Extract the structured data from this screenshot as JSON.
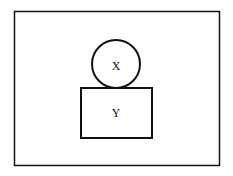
{
  "diagram": {
    "frame": {
      "x": 14,
      "y": 11,
      "width": 205,
      "height": 154,
      "stroke": "#111111"
    },
    "circle": {
      "label": "X",
      "cx": 116,
      "cy": 64,
      "r": 24,
      "stroke": "#111111"
    },
    "box": {
      "label": "Y",
      "x": 81,
      "y": 88,
      "width": 71,
      "height": 50,
      "stroke": "#111111"
    }
  }
}
